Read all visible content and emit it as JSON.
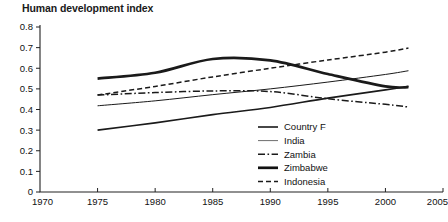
{
  "chart_data": {
    "type": "line",
    "title": "Human development index",
    "xlabel": "",
    "ylabel": "",
    "xlim": [
      1970,
      2005
    ],
    "ylim": [
      0,
      0.8
    ],
    "grid": false,
    "legend_position": "inside-bottom-center",
    "xticks": [
      "1970",
      "1975",
      "1980",
      "1985",
      "1990",
      "1995",
      "2000",
      "2005"
    ],
    "xtick_values": [
      1970,
      1975,
      1980,
      1985,
      1990,
      1995,
      2000,
      2005
    ],
    "yticks": [
      "0",
      "0.1",
      "0.2",
      "0.3",
      "0.4",
      "0.5",
      "0.6",
      "0.7",
      "0.8"
    ],
    "ytick_values": [
      0,
      0.1,
      0.2,
      0.3,
      0.4,
      0.5,
      0.6,
      0.7,
      0.8
    ],
    "x": [
      1975,
      1980,
      1985,
      1990,
      1995,
      2000,
      2002
    ],
    "series": [
      {
        "name": "Country F",
        "style": "solid",
        "width": 1.6,
        "color": "#1a1a1a",
        "values": [
          0.3,
          0.335,
          0.375,
          0.41,
          0.455,
          0.495,
          0.512
        ]
      },
      {
        "name": "India",
        "style": "solid",
        "width": 1.0,
        "color": "#6e6e6e",
        "values": [
          0.418,
          0.442,
          0.472,
          0.5,
          0.533,
          0.57,
          0.588
        ]
      },
      {
        "name": "Zambia",
        "style": "dashdot",
        "width": 1.5,
        "color": "#1a1a1a",
        "values": [
          0.47,
          0.482,
          0.49,
          0.487,
          0.452,
          0.425,
          0.412
        ]
      },
      {
        "name": "Zimbabwe",
        "style": "solid",
        "width": 2.7,
        "color": "#111111",
        "values": [
          0.55,
          0.578,
          0.645,
          0.638,
          0.572,
          0.512,
          0.508
        ]
      },
      {
        "name": "Indonesia",
        "style": "dashed",
        "width": 1.5,
        "color": "#1a1a1a",
        "values": [
          0.47,
          0.512,
          0.558,
          0.6,
          0.64,
          0.678,
          0.698
        ]
      }
    ]
  },
  "legend": {
    "entries": [
      {
        "label": "Country F"
      },
      {
        "label": "India"
      },
      {
        "label": "Zambia"
      },
      {
        "label": "Zimbabwe"
      },
      {
        "label": "Indonesia"
      }
    ]
  }
}
